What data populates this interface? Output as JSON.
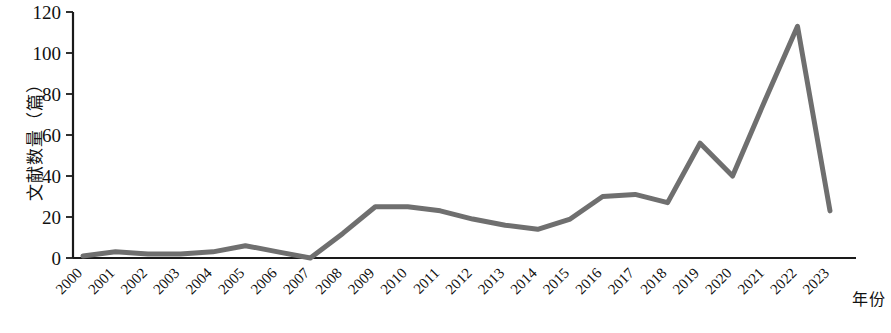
{
  "chart_data": {
    "type": "line",
    "title": "",
    "xlabel": "年份",
    "ylabel": "文献数量（篇）",
    "categories": [
      "2000",
      "2001",
      "2002",
      "2003",
      "2004",
      "2005",
      "2006",
      "2007",
      "2008",
      "2009",
      "2010",
      "2011",
      "2012",
      "2013",
      "2014",
      "2015",
      "2016",
      "2017",
      "2018",
      "2019",
      "2020",
      "2021",
      "2022",
      "2023"
    ],
    "values": [
      1,
      3,
      2,
      2,
      3,
      6,
      3,
      0,
      12,
      25,
      25,
      23,
      19,
      16,
      14,
      19,
      30,
      31,
      27,
      56,
      40,
      77,
      113,
      23
    ],
    "series": [
      {
        "name": "文献数量",
        "color": "#6f6f6f",
        "values": [
          1,
          3,
          2,
          2,
          3,
          6,
          3,
          0,
          12,
          25,
          25,
          23,
          19,
          16,
          14,
          19,
          30,
          31,
          27,
          56,
          40,
          77,
          113,
          23
        ]
      }
    ],
    "yticks": [
      0,
      20,
      40,
      60,
      80,
      100,
      120
    ],
    "ylim": [
      0,
      120
    ],
    "xlim": [
      "2000",
      "2023"
    ],
    "grid": false,
    "legend": false,
    "legend_position": "none",
    "x_tick_rotation": -45
  },
  "axes": {
    "y_axis_title": "文献数量（篇）",
    "x_axis_title": "年份"
  },
  "style": {
    "line_color": "#6f6f6f",
    "axis_color": "#1a1a1a",
    "text_color": "#111111",
    "background": "#ffffff"
  }
}
